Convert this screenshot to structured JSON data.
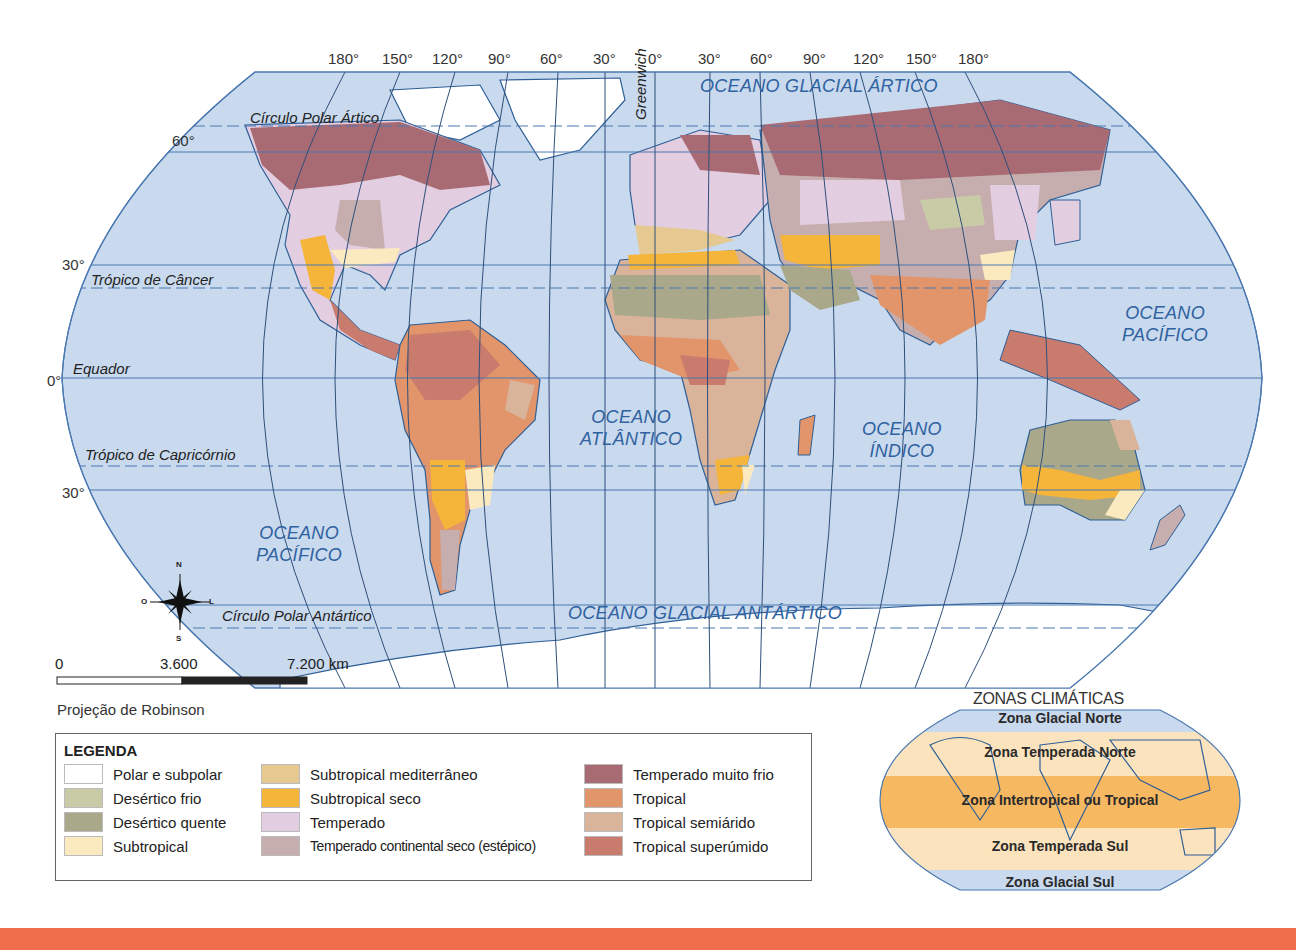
{
  "map": {
    "projection_label": "Projeção de Robinson",
    "longitude_labels": [
      "180°",
      "150°",
      "120°",
      "90°",
      "60°",
      "30°",
      "0°",
      "30°",
      "60°",
      "90°",
      "120°",
      "150°",
      "180°"
    ],
    "latitude_labels": {
      "lat60": "60°",
      "lat30n": "30°",
      "lat0": "0°",
      "lat30s": "30°"
    },
    "lines": {
      "arctic_circle": "Círculo Polar Ártico",
      "tropic_cancer": "Trópico de Câncer",
      "equator": "Equador",
      "tropic_capricorn": "Trópico de Capricórnio",
      "antarctic_circle": "Círculo Polar Antártico",
      "greenwich": "Greenwich"
    },
    "oceans": {
      "arctic": "OCEANO GLACIAL ÁRTICO",
      "pacific_east_1": "OCEANO",
      "pacific_east_2": "PACÍFICO",
      "atlantic_1": "OCEANO",
      "atlantic_2": "ATLÂNTICO",
      "indian_1": "OCEANO",
      "indian_2": "ÍNDICO",
      "pacific_west_1": "OCEANO",
      "pacific_west_2": "PACÍFICO",
      "antarctic": "OCEANO GLACIAL ANTÁRTICO"
    },
    "compass": {
      "n": "N",
      "s": "S",
      "e": "L",
      "w": "O"
    },
    "scale": {
      "start": "0",
      "mid": "3.600",
      "end": "7.200 km"
    }
  },
  "legend": {
    "title": "LEGENDA",
    "items": [
      {
        "label": "Polar e subpolar",
        "color": "#ffffff"
      },
      {
        "label": "Desértico frio",
        "color": "#c8cba6"
      },
      {
        "label": "Desértico quente",
        "color": "#a9a88a"
      },
      {
        "label": "Subtropical",
        "color": "#fbeac0"
      },
      {
        "label": "Subtropical mediterrâneo",
        "color": "#e6c991"
      },
      {
        "label": "Subtropical seco",
        "color": "#f5b43a"
      },
      {
        "label": "Temperado",
        "color": "#e3cde0"
      },
      {
        "label": "Temperado continental seco (estépico)",
        "color": "#c6aeae"
      },
      {
        "label": "Temperado muito frio",
        "color": "#a86a73"
      },
      {
        "label": "Tropical",
        "color": "#e2946a"
      },
      {
        "label": "Tropical semiárido",
        "color": "#d9b39a"
      },
      {
        "label": "Tropical superúmido",
        "color": "#c97b6d"
      }
    ]
  },
  "zones": {
    "title": "ZONAS CLIMÁTICAS",
    "glacial_norte": "Zona  Glacial Norte",
    "temperada_norte": "Zona Temperada Norte",
    "intertropical": "Zona Intertropical ou Tropical",
    "temperada_sul": "Zona Temperada Sul",
    "glacial_sul": "Zona  Glacial Sul"
  },
  "colors": {
    "ocean": "#c9d9ee",
    "grid": "#4a78b0",
    "coast": "#2e5f96",
    "footer": "#f06e4b"
  }
}
